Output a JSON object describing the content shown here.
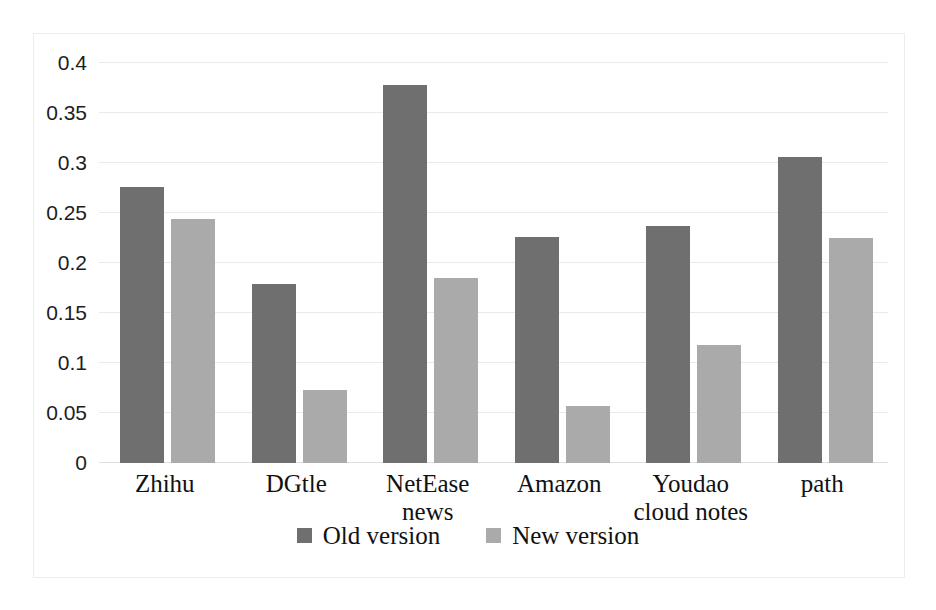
{
  "chart_data": {
    "type": "bar",
    "title": "",
    "xlabel": "",
    "ylabel": "",
    "ylim": [
      0,
      0.4
    ],
    "grid": true,
    "legend_position": "bottom",
    "categories": [
      "Zhihu",
      "DGtle",
      "NetEase news",
      "Amazon",
      "Youdao cloud notes",
      "path"
    ],
    "ytick_labels": [
      "0.4",
      "0.35",
      "0.3",
      "0.25",
      "0.2",
      "0.15",
      "0.1",
      "0.05",
      "0"
    ],
    "ytick_values": [
      0.4,
      0.35,
      0.3,
      0.25,
      0.2,
      0.15,
      0.1,
      0.05,
      0
    ],
    "series": [
      {
        "name": "Old version",
        "color": "#6f6f6f",
        "values": [
          0.275,
          0.179,
          0.377,
          0.225,
          0.236,
          0.305
        ]
      },
      {
        "name": "New version",
        "color": "#aaaaaa",
        "values": [
          0.243,
          0.073,
          0.185,
          0.057,
          0.118,
          0.224
        ]
      }
    ]
  },
  "legend": {
    "items": [
      {
        "label": "Old version",
        "color": "#6f6f6f"
      },
      {
        "label": "New version",
        "color": "#aaaaaa"
      }
    ]
  }
}
